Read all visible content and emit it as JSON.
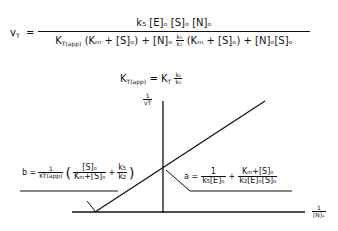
{
  "equation_main": {
    "lhs": "v",
    "lhs_sub": "T",
    "equals": "=",
    "numerator": "k₅ [E]ₒ [S]ₒ [N]ₒ",
    "denominator_part1": "K",
    "denominator_part1_sub": "T(app)",
    "denominator_part2": "(Kₘ + [S]ₒ) + [N]ₒ",
    "denominator_frac_num": "k₅",
    "denominator_frac_den": "k₂",
    "denominator_part3": "(Kₘ + [S]ₒ) + [N]ₒ[S]ₒ"
  },
  "equation_kapp": {
    "lhs": "K",
    "lhs_sub": "T(app)",
    "equals": "=",
    "rhs": "K",
    "rhs_sub": "T",
    "frac_num": "k₅",
    "frac_den": "k₂"
  },
  "plot": {
    "y_axis_label_num": "1",
    "y_axis_label_den": "vT",
    "x_axis_label_num": "1",
    "x_axis_label_den": "[N]ₒ"
  },
  "annotation_b": {
    "label": "b =",
    "frac1_num": "1",
    "frac1_den": "KT(app)",
    "paren_open": "(",
    "frac2_num": "[S]ₒ",
    "frac2_den": "Kₘ+[S]ₒ",
    "plus": "+",
    "frac3_num": "k₅",
    "frac3_den": "k₂",
    "paren_close": ")"
  },
  "annotation_a": {
    "label": "a =",
    "frac1_num": "1",
    "frac1_den": "k₅[E]ₒ",
    "plus": "+",
    "frac2_num": "Kₘ+[S]ₒ",
    "frac2_den": "k₂[E]ₒ[S]ₒ"
  },
  "colors": {
    "ink": "#111111",
    "background": "#ffffff"
  }
}
